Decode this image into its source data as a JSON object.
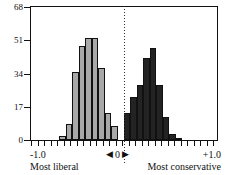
{
  "chart_data": {
    "type": "bar",
    "title": "",
    "subtitle": "",
    "xlabel": "",
    "ylabel": "",
    "xlim": [
      -1.0,
      1.0
    ],
    "ylim": [
      0,
      68
    ],
    "grid": false,
    "legend": null,
    "y_ticks": [
      0,
      17,
      34,
      51,
      68
    ],
    "y_tick_labels": [
      "0",
      "17",
      "34",
      "51",
      "68"
    ],
    "x_tick_labels": [
      "-1.0",
      "0",
      "+1.0"
    ],
    "annotations": {
      "left_end": "Most liberal",
      "right_end": "Most conservative",
      "zero_marker": "0",
      "zero_left_arrow": "◀",
      "zero_right_arrow": "▶",
      "zero_reference_line": true
    },
    "colors": {
      "left_series": "#a8a8a8",
      "right_series": "#232323",
      "axis": "#111111",
      "background": "#ffffff"
    },
    "series": [
      {
        "name": "Liberal side",
        "color": "#a8a8a8",
        "bins": [
          {
            "x": -0.8,
            "value": 0
          },
          {
            "x": -0.73,
            "value": 0
          },
          {
            "x": -0.66,
            "value": 2
          },
          {
            "x": -0.59,
            "value": 8
          },
          {
            "x": -0.52,
            "value": 35
          },
          {
            "x": -0.45,
            "value": 48
          },
          {
            "x": -0.38,
            "value": 52
          },
          {
            "x": -0.31,
            "value": 52
          },
          {
            "x": -0.24,
            "value": 37
          },
          {
            "x": -0.17,
            "value": 14
          },
          {
            "x": -0.1,
            "value": 7
          }
        ]
      },
      {
        "name": "Conservative side",
        "color": "#232323",
        "bins": [
          {
            "x": 0.03,
            "value": 14
          },
          {
            "x": 0.1,
            "value": 22
          },
          {
            "x": 0.17,
            "value": 28
          },
          {
            "x": 0.24,
            "value": 42
          },
          {
            "x": 0.31,
            "value": 47
          },
          {
            "x": 0.38,
            "value": 28
          },
          {
            "x": 0.45,
            "value": 12
          },
          {
            "x": 0.52,
            "value": 3
          },
          {
            "x": 0.59,
            "value": 1
          }
        ]
      }
    ]
  }
}
